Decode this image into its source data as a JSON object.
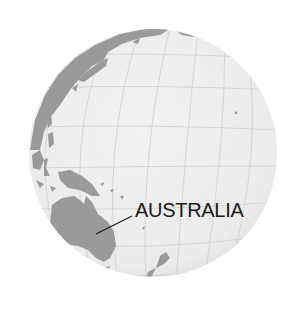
{
  "map": {
    "type": "orthographic-globe",
    "focus_region": "Pacific Ocean / Oceania",
    "colors": {
      "ocean": "#ededed",
      "land": "#9a9a9a",
      "graticule": "#cfcfcf",
      "leader_line": "#1a1a1a",
      "label": "#1a1a1a"
    },
    "labels": [
      {
        "id": "australia",
        "text": "AUSTRALIA"
      }
    ],
    "visible_landmasses": [
      "East Asia",
      "Japan",
      "Philippines",
      "Indonesia",
      "New Guinea",
      "Australia",
      "New Zealand",
      "Pacific islands"
    ]
  }
}
